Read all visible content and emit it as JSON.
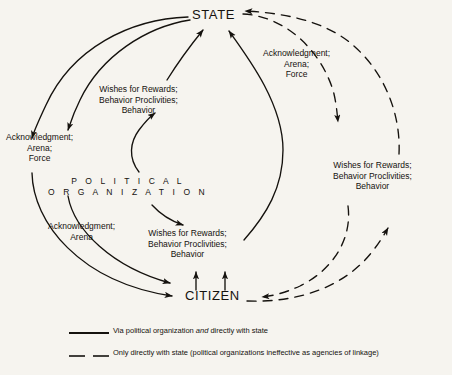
{
  "figure": {
    "background_color": "#f6f4ef",
    "ink_color": "#15120e"
  },
  "nodes": {
    "state": "STATE",
    "citizen": "CITIZEN",
    "political_organization": {
      "line1": "P O L I T I C A L",
      "line2": "O R G A N I Z A T I O N"
    }
  },
  "edge_labels": {
    "acknowledgment_left": {
      "line1": "Acknowledgment;",
      "line2": "Arena;",
      "line3": "Force"
    },
    "wishes_upper": {
      "line1": "Wishes for Rewards;",
      "line2": "Behavior Proclivities;",
      "line3": "Behavior"
    },
    "acknowledgment_right": {
      "line1": "Acknowledgment;",
      "line2": "Arena;",
      "line3": "Force"
    },
    "wishes_right": {
      "line1": "Wishes for Rewards;",
      "line2": "Behavior Proclivities;",
      "line3": "Behavior"
    },
    "acknowledgment_lower_left": {
      "line1": "Acknowledgment;",
      "line2": "Arena"
    },
    "wishes_lower": {
      "line1": "Wishes for Rewards;",
      "line2": "Behavior Proclivities;",
      "line3": "Behavior"
    }
  },
  "legend": {
    "items": [
      {
        "style": "solid",
        "text_before": "Via political organization ",
        "emphasis": "and",
        "text_after": " directly with state"
      },
      {
        "style": "dashed",
        "text_before": "Only directly with state (political organizations ineffective as agencies of linkage)",
        "emphasis": "",
        "text_after": ""
      }
    ]
  }
}
